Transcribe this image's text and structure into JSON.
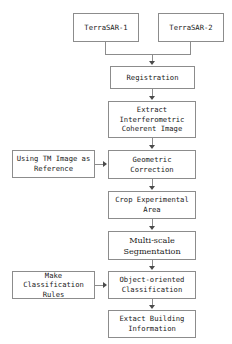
{
  "diagram": {
    "background_color": "#ffffff",
    "border_color": "#8c8c8c",
    "text_color": "#1a1a1a",
    "arrow_color": "#4a4a4a",
    "nodes": {
      "terrasar1": "TerraSAR-1",
      "terrasar2": "TerraSAR-2",
      "registration": "Registration",
      "extract_coherent": "Extract\nInterferometric\nCoherent Image",
      "tm_reference": "Using TM Image as\nReference",
      "geometric_correction": "Geometric\nCorrection",
      "crop_area": "Crop Experimental\nArea",
      "segmentation": "Multi-scale\nSegmentation",
      "classification_rules": "Make Classification\nRules",
      "object_classification": "Object-oriented\nClassification",
      "extract_building": "Extact Building\nInformation"
    }
  }
}
